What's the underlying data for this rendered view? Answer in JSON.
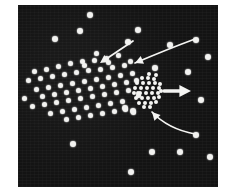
{
  "figure": {
    "panel": {
      "background_color": "#131313",
      "x": 18,
      "y": 5,
      "width": 200,
      "height": 182
    },
    "page_background_color": "#ffffff",
    "particle_color": "#f2f2f0",
    "arrow_color": "#f4f4f2"
  },
  "chart_data": {
    "type": "scatter",
    "title": "",
    "xlabel": "",
    "ylabel": "",
    "xlim": [
      0,
      200
    ],
    "ylim": [
      0,
      182
    ],
    "grid": false,
    "legend": null,
    "axes_visible": false,
    "background": "#131313",
    "marker_color": "#f2f2f0",
    "marker_size_px": 5,
    "series": [
      {
        "name": "diffuse-particle-field",
        "marker_size_px": 5,
        "points": [
          [
            16,
            66
          ],
          [
            28,
            64
          ],
          [
            40,
            61
          ],
          [
            52,
            58
          ],
          [
            64,
            56
          ],
          [
            76,
            55
          ],
          [
            88,
            53
          ],
          [
            10,
            75
          ],
          [
            22,
            73
          ],
          [
            34,
            71
          ],
          [
            46,
            69
          ],
          [
            58,
            67
          ],
          [
            70,
            65
          ],
          [
            82,
            64
          ],
          [
            94,
            62
          ],
          [
            106,
            60
          ],
          [
            18,
            84
          ],
          [
            30,
            82
          ],
          [
            42,
            80
          ],
          [
            54,
            78
          ],
          [
            66,
            76
          ],
          [
            78,
            74
          ],
          [
            90,
            72
          ],
          [
            102,
            70
          ],
          [
            114,
            68
          ],
          [
            6,
            93
          ],
          [
            24,
            91
          ],
          [
            36,
            89
          ],
          [
            48,
            87
          ],
          [
            60,
            85
          ],
          [
            72,
            83
          ],
          [
            84,
            81
          ],
          [
            96,
            79
          ],
          [
            108,
            77
          ],
          [
            14,
            101
          ],
          [
            26,
            99
          ],
          [
            38,
            97
          ],
          [
            50,
            95
          ],
          [
            62,
            93
          ],
          [
            74,
            91
          ],
          [
            86,
            89
          ],
          [
            98,
            87
          ],
          [
            110,
            85
          ],
          [
            32,
            108
          ],
          [
            44,
            106
          ],
          [
            56,
            104
          ],
          [
            68,
            102
          ],
          [
            80,
            100
          ],
          [
            92,
            98
          ],
          [
            104,
            96
          ],
          [
            48,
            114
          ],
          [
            60,
            112
          ],
          [
            72,
            110
          ],
          [
            84,
            108
          ],
          [
            96,
            106
          ],
          [
            107,
            104
          ],
          [
            115,
            107
          ],
          [
            66,
            60
          ],
          [
            78,
            48
          ],
          [
            90,
            57
          ],
          [
            100,
            50
          ],
          [
            112,
            56
          ],
          [
            118,
            75
          ],
          [
            120,
            90
          ]
        ]
      },
      {
        "name": "sparse-background-particles",
        "marker_size_px": 6,
        "points": [
          [
            72,
            10
          ],
          [
            62,
            26
          ],
          [
            37,
            34
          ],
          [
            120,
            25
          ],
          [
            178,
            35
          ],
          [
            110,
            37
          ],
          [
            152,
            40
          ],
          [
            190,
            52
          ],
          [
            137,
            63
          ],
          [
            170,
            67
          ],
          [
            183,
            95
          ],
          [
            178,
            130
          ],
          [
            55,
            139
          ],
          [
            107,
            103
          ],
          [
            115,
            106
          ],
          [
            134,
            147
          ],
          [
            162,
            147
          ],
          [
            113,
            167
          ],
          [
            192,
            152
          ]
        ]
      },
      {
        "name": "dense-aggregate",
        "center": [
          129,
          84
        ],
        "radius_px": 11,
        "count": 33,
        "marker_size_px": 4,
        "points": [
          [
            124,
            73
          ],
          [
            130,
            73
          ],
          [
            136,
            74
          ],
          [
            119,
            78
          ],
          [
            125,
            78
          ],
          [
            131,
            78
          ],
          [
            137,
            78
          ],
          [
            142,
            79
          ],
          [
            117,
            83
          ],
          [
            123,
            83
          ],
          [
            129,
            83
          ],
          [
            135,
            83
          ],
          [
            141,
            83
          ],
          [
            116,
            88
          ],
          [
            122,
            88
          ],
          [
            128,
            88
          ],
          [
            134,
            88
          ],
          [
            140,
            88
          ],
          [
            118,
            93
          ],
          [
            124,
            93
          ],
          [
            130,
            93
          ],
          [
            136,
            93
          ],
          [
            141,
            92
          ],
          [
            121,
            98
          ],
          [
            127,
            98
          ],
          [
            133,
            98
          ],
          [
            138,
            97
          ],
          [
            126,
            102
          ],
          [
            132,
            102
          ],
          [
            120,
            88
          ],
          [
            131,
            69
          ],
          [
            138,
            70
          ],
          [
            143,
            86
          ]
        ]
      }
    ],
    "annotations": [
      {
        "name": "arrow-inflow-upper-left",
        "type": "straight-arrow",
        "from": [
          115,
          36
        ],
        "to": [
          82,
          58
        ],
        "direction": "down-left",
        "meaning": "inflow toward field"
      },
      {
        "name": "arrow-inflow-upper-curved",
        "type": "curved-arrow",
        "from": [
          177,
          34
        ],
        "control": [
          150,
          44
        ],
        "to": [
          117,
          58
        ],
        "direction": "left",
        "meaning": "curved inflow toward aggregate"
      },
      {
        "name": "arrow-inflow-lower-curved",
        "type": "curved-arrow",
        "from": [
          177,
          129
        ],
        "control": [
          150,
          124
        ],
        "to": [
          134,
          107
        ],
        "direction": "up-left",
        "meaning": "curved inflow toward aggregate"
      },
      {
        "name": "arrow-outflow-right",
        "type": "straight-arrow",
        "from": [
          146,
          86
        ],
        "to": [
          173,
          86
        ],
        "direction": "right",
        "meaning": "aggregate ejection / outflow"
      }
    ]
  }
}
